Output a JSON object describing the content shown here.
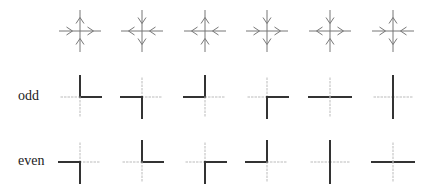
{
  "figure": {
    "rows": [
      {
        "id": "arrows",
        "label": ""
      },
      {
        "id": "odd",
        "label": "odd"
      },
      {
        "id": "even",
        "label": "even"
      }
    ],
    "columns_x": [
      80,
      142,
      205,
      267,
      330,
      393
    ],
    "rows_y": {
      "arrows": 31,
      "odd": 97,
      "even": 162
    },
    "arm_length": 21,
    "colors": {
      "arrow": "#777777",
      "solid": "#333333",
      "dotted": "#bbbbbb"
    },
    "arrow_glyphs": [
      {
        "left": "right",
        "right": "right",
        "top": "up",
        "bottom": "up"
      },
      {
        "left": "left",
        "right": "left",
        "top": "down",
        "bottom": "down"
      },
      {
        "left": "left",
        "right": "left",
        "top": "up",
        "bottom": "up"
      },
      {
        "left": "right",
        "right": "right",
        "top": "down",
        "bottom": "down"
      },
      {
        "left": "left",
        "right": "right",
        "top": "down",
        "bottom": "up"
      },
      {
        "left": "right",
        "right": "left",
        "top": "up",
        "bottom": "down"
      }
    ],
    "odd_tiles": [
      {
        "solid": [
          "top",
          "right"
        ]
      },
      {
        "solid": [
          "left",
          "bottom"
        ]
      },
      {
        "solid": [
          "left",
          "top"
        ]
      },
      {
        "solid": [
          "right",
          "bottom"
        ]
      },
      {
        "solid": [
          "left",
          "right"
        ]
      },
      {
        "solid": [
          "top",
          "bottom"
        ]
      }
    ],
    "even_tiles": [
      {
        "solid": [
          "left",
          "bottom"
        ]
      },
      {
        "solid": [
          "top",
          "right"
        ]
      },
      {
        "solid": [
          "right",
          "bottom"
        ]
      },
      {
        "solid": [
          "left",
          "top"
        ]
      },
      {
        "solid": [
          "top",
          "bottom"
        ]
      },
      {
        "solid": [
          "left",
          "right"
        ]
      }
    ]
  }
}
